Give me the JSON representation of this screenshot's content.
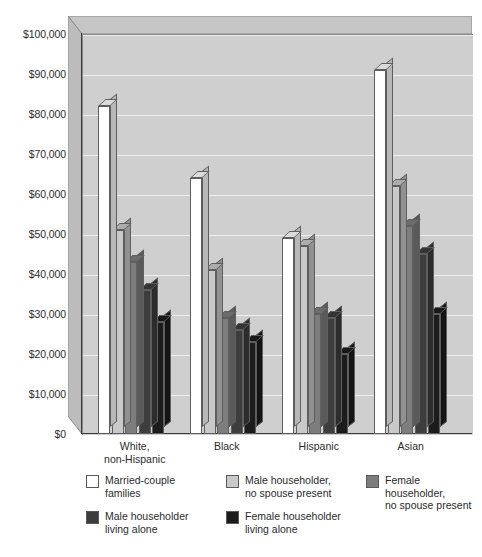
{
  "chart_data": {
    "type": "bar",
    "title": "",
    "xlabel": "",
    "ylabel": "",
    "ylim": [
      0,
      100000
    ],
    "grid": true,
    "legend_position": "bottom",
    "style": "3d-clustered-column",
    "categories": [
      "White,\nnon-Hispanic",
      "Black",
      "Hispanic",
      "Asian"
    ],
    "y_ticks": [
      "$0",
      "$10,000",
      "$20,000",
      "$30,000",
      "$40,000",
      "$50,000",
      "$60,000",
      "$70,000",
      "$80,000",
      "$90,000",
      "$100,000"
    ],
    "series": [
      {
        "name": "Married-couple\nfamilies",
        "color": "#ffffff",
        "values": [
          82000,
          64000,
          49000,
          91000
        ]
      },
      {
        "name": "Male householder,\nno spouse present",
        "color": "#c9c9c9",
        "values": [
          51000,
          41000,
          47000,
          62000
        ]
      },
      {
        "name": "Female householder,\nno spouse present",
        "color": "#7d7d7d",
        "values": [
          43000,
          29000,
          30000,
          52000
        ]
      },
      {
        "name": "Male householder\nliving alone",
        "color": "#3d3d3d",
        "values": [
          36000,
          26000,
          29000,
          45000
        ]
      },
      {
        "name": "Female householder\nliving alone",
        "color": "#1c1c1c",
        "values": [
          28000,
          23000,
          20000,
          30000
        ]
      }
    ]
  },
  "colors": {
    "plot_background": "#cfcfcf",
    "wall_shade": "#b9b9b9",
    "ceiling_shade": "#c4c4c4",
    "gridline": "#efefef",
    "axis": "#3a3a3a",
    "text": "#2b2b2b"
  }
}
